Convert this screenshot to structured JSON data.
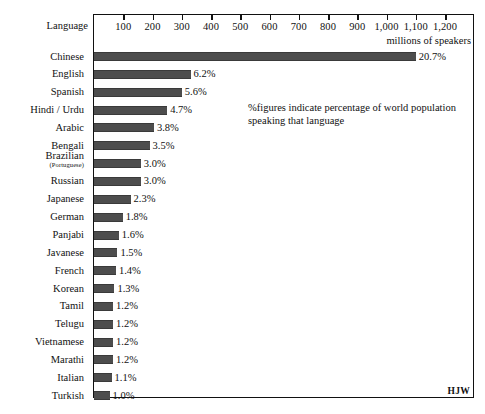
{
  "chart_data": {
    "type": "bar",
    "orientation": "horizontal",
    "title": "",
    "xlabel": "millions of speakers",
    "ylabel": "Language",
    "xlim": [
      0,
      1200
    ],
    "xticks": [
      100,
      200,
      300,
      400,
      500,
      600,
      700,
      800,
      900,
      1000,
      1100,
      1200
    ],
    "xtick_labels": [
      "100",
      "200",
      "300",
      "400",
      "500",
      "600",
      "700",
      "800",
      "900",
      "1,000",
      "1,100",
      "1,200"
    ],
    "grid": false,
    "legend": null,
    "annotation": "%figures indicate percentage of world population speaking that language",
    "annotation_lines": [
      "%figures indicate percentage of world population",
      "speaking that language"
    ],
    "signature": "HJW",
    "bar_color": "#4d4d4d",
    "categories": [
      "Chinese",
      "English",
      "Spanish",
      "Hindi / Urdu",
      "Arabic",
      "Bengali",
      "Brazilian (Portuguese)",
      "Russian",
      "Japanese",
      "German",
      "Panjabi",
      "Javanese",
      "French",
      "Korean",
      "Tamil",
      "Telugu",
      "Vietnamese",
      "Marathi",
      "Italian",
      "Turkish"
    ],
    "series": [
      {
        "name": "millions of speakers",
        "values": [
          1100,
          330,
          300,
          250,
          205,
          190,
          160,
          160,
          125,
          98,
          85,
          80,
          75,
          70,
          65,
          65,
          65,
          65,
          60,
          53
        ]
      }
    ],
    "percent_labels": [
      "20.7%",
      "6.2%",
      "5.6%",
      "4.7%",
      "3.8%",
      "3.5%",
      "3.0%",
      "3.0%",
      "2.3%",
      "1.8%",
      "1.6%",
      "1.5%",
      "1.4%",
      "1.3%",
      "1.2%",
      "1.2%",
      "1.2%",
      "1.2%",
      "1.1%",
      "1.0%"
    ]
  },
  "rows": [
    {
      "label": "Chinese",
      "sub": "",
      "value": 1100,
      "percent": "20.7%"
    },
    {
      "label": "English",
      "sub": "",
      "value": 330,
      "percent": "6.2%"
    },
    {
      "label": "Spanish",
      "sub": "",
      "value": 300,
      "percent": "5.6%"
    },
    {
      "label": "Hindi / Urdu",
      "sub": "",
      "value": 250,
      "percent": "4.7%"
    },
    {
      "label": "Arabic",
      "sub": "",
      "value": 205,
      "percent": "3.8%"
    },
    {
      "label": "Bengali",
      "sub": "",
      "value": 190,
      "percent": "3.5%"
    },
    {
      "label": "Brazilian",
      "sub": "(Portuguese)",
      "value": 160,
      "percent": "3.0%"
    },
    {
      "label": "Russian",
      "sub": "",
      "value": 160,
      "percent": "3.0%"
    },
    {
      "label": "Japanese",
      "sub": "",
      "value": 125,
      "percent": "2.3%"
    },
    {
      "label": "German",
      "sub": "",
      "value": 98,
      "percent": "1.8%"
    },
    {
      "label": "Panjabi",
      "sub": "",
      "value": 85,
      "percent": "1.6%"
    },
    {
      "label": "Javanese",
      "sub": "",
      "value": 80,
      "percent": "1.5%"
    },
    {
      "label": "French",
      "sub": "",
      "value": 75,
      "percent": "1.4%"
    },
    {
      "label": "Korean",
      "sub": "",
      "value": 70,
      "percent": "1.3%"
    },
    {
      "label": "Tamil",
      "sub": "",
      "value": 65,
      "percent": "1.2%"
    },
    {
      "label": "Telugu",
      "sub": "",
      "value": 65,
      "percent": "1.2%"
    },
    {
      "label": "Vietnamese",
      "sub": "",
      "value": 65,
      "percent": "1.2%"
    },
    {
      "label": "Marathi",
      "sub": "",
      "value": 65,
      "percent": "1.2%"
    },
    {
      "label": "Italian",
      "sub": "",
      "value": 60,
      "percent": "1.1%"
    },
    {
      "label": "Turkish",
      "sub": "",
      "value": 53,
      "percent": "1.0%"
    }
  ],
  "axis": {
    "language_header": "Language",
    "unit_caption": "millions of speakers"
  }
}
